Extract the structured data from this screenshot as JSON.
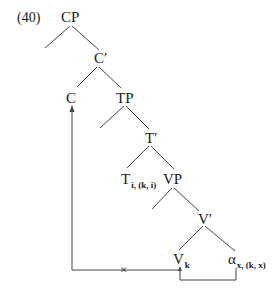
{
  "example_number": "(40)",
  "tree": {
    "nodes": {
      "cp": "CP",
      "c_bar": "C′",
      "c": "C",
      "tp": "TP",
      "t_bar": "T′",
      "t_head": "T",
      "t_head_sub": "i, (k, i)",
      "vp": "VP",
      "v_bar": "V′",
      "v_head": "V",
      "v_head_sub": "k",
      "alpha": "α",
      "alpha_sub": "x, (k, x)"
    },
    "movement": {
      "blocked_marker": "×",
      "description": "alpha moves to V_k (allowed); V_k to C movement blocked (x)"
    }
  },
  "colors": {
    "line": "#444444",
    "text": "#1a1a1a"
  }
}
